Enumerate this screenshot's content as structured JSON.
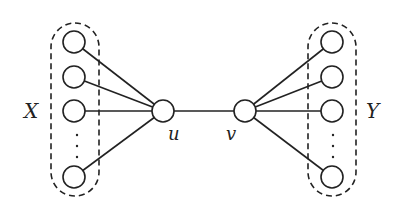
{
  "diagram": {
    "type": "graph",
    "colors": {
      "stroke": "#222222",
      "background": "#ffffff",
      "node_fill": "#ffffff"
    },
    "sets": [
      {
        "id": "X",
        "label": "X"
      },
      {
        "id": "Y",
        "label": "Y"
      }
    ],
    "nodes": [
      {
        "id": "u",
        "label": "u"
      },
      {
        "id": "v",
        "label": "v"
      }
    ],
    "ellipsis": ". . .",
    "edges": [
      [
        "X1",
        "u"
      ],
      [
        "X2",
        "u"
      ],
      [
        "X3",
        "u"
      ],
      [
        "Xn",
        "u"
      ],
      [
        "u",
        "v"
      ],
      [
        "v",
        "Y1"
      ],
      [
        "v",
        "Y2"
      ],
      [
        "v",
        "Y3"
      ],
      [
        "v",
        "Yn"
      ]
    ]
  }
}
